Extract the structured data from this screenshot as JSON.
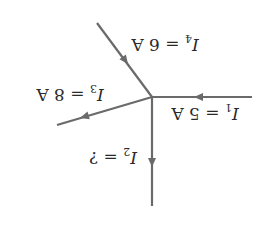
{
  "diagram": {
    "orientation": "rotated 180 degrees",
    "colors": {
      "wire": "#6a6a6a",
      "text": "#2a2a2a",
      "background": "#ffffff"
    },
    "junction": {
      "x": 152,
      "y": 97
    },
    "currents": [
      {
        "id": "I1",
        "symbol": "I",
        "subscript": "1",
        "equals": "=",
        "value": "5 A",
        "direction": "into-junction"
      },
      {
        "id": "I2",
        "symbol": "I",
        "subscript": "2",
        "equals": "=",
        "value": "?",
        "direction": "out-of-junction"
      },
      {
        "id": "I3",
        "symbol": "I",
        "subscript": "3",
        "equals": "=",
        "value": "8 A",
        "direction": "out-of-junction"
      },
      {
        "id": "I4",
        "symbol": "I",
        "subscript": "4",
        "equals": "=",
        "value": "6 A",
        "direction": "into-junction"
      }
    ]
  }
}
